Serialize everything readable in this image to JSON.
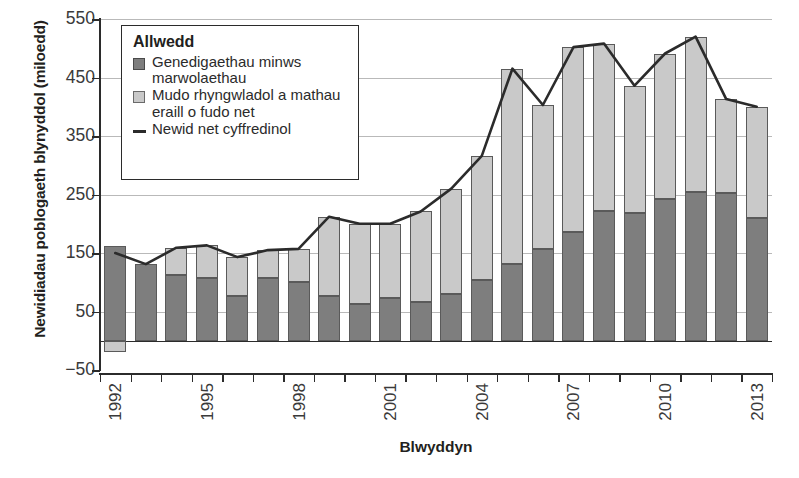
{
  "chart_data": {
    "type": "bar",
    "title": "",
    "xlabel": "Blwyddyn",
    "ylabel": "Newidiadau poblogaeth blynyddol (miloedd)",
    "ylim": [
      -50,
      550
    ],
    "ytick_values": [
      550,
      450,
      350,
      250,
      150,
      50,
      -50
    ],
    "ytick_labels": [
      "550",
      "450",
      "350",
      "250",
      "150",
      "50",
      "−50"
    ],
    "grid": true,
    "stacked": true,
    "legend_position": "top-left",
    "legend_title": "Allwedd",
    "categories": [
      1992,
      1993,
      1994,
      1995,
      1996,
      1997,
      1998,
      1999,
      2000,
      2001,
      2002,
      2003,
      2004,
      2005,
      2006,
      2007,
      2008,
      2009,
      2010,
      2011,
      2012,
      2013
    ],
    "xtick_labels": [
      "1992",
      "1995",
      "1998",
      "2001",
      "2004",
      "2007",
      "2010",
      "2013"
    ],
    "xtick_label_years": [
      1992,
      1995,
      1998,
      2001,
      2004,
      2007,
      2010,
      2013
    ],
    "series": [
      {
        "name": "Genedigaethau minws marwolaethau",
        "color": "#7e7e7e",
        "values": [
          162,
          131,
          113,
          107,
          76,
          107,
          101,
          76,
          62,
          73,
          66,
          80,
          103,
          131,
          156,
          186,
          221,
          219,
          243,
          254,
          253,
          210
        ]
      },
      {
        "name": "Mudo rhyngwladol a mathau eraill o fudo net",
        "color": "#c9c9c9",
        "values": [
          -20,
          0,
          46,
          56,
          67,
          48,
          56,
          136,
          138,
          127,
          155,
          180,
          213,
          334,
          247,
          316,
          287,
          217,
          248,
          266,
          160,
          190
        ]
      }
    ],
    "line_series": {
      "name": "Newid net cyffredinol",
      "color": "#2b2b2b",
      "values": [
        150,
        131,
        159,
        163,
        143,
        155,
        157,
        212,
        200,
        200,
        221,
        260,
        316,
        465,
        403,
        502,
        508,
        436,
        491,
        520,
        413,
        400
      ]
    }
  },
  "legend": {
    "title": "Allwedd",
    "items": [
      {
        "swatch": "dark",
        "label": "Genedigaethau minws marwolaethau"
      },
      {
        "swatch": "light",
        "label": "Mudo rhyngwladol a mathau eraill o fudo net"
      },
      {
        "swatch": "line",
        "label": "Newid net cyffredinol"
      }
    ]
  }
}
